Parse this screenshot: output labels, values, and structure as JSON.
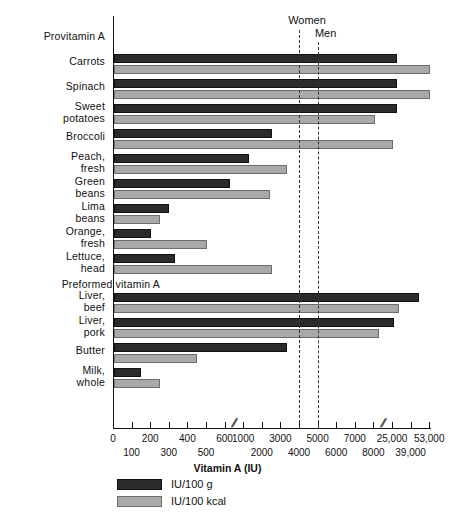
{
  "chart_data": {
    "type": "bar",
    "orientation": "horizontal",
    "title": "",
    "xlabel": "Vitamin A (IU)",
    "ylabel": "",
    "grid": false,
    "legend_position": "bottom-left",
    "axis_note": "broken axis: compressed scale segments",
    "tick_labels_upper": [
      "0",
      "200",
      "400",
      "600",
      "1000",
      "3000",
      "5000",
      "7000",
      "25,000",
      "53,000"
    ],
    "tick_labels_lower": [
      "100",
      "300",
      "500",
      "2000",
      "4000",
      "6000",
      "8000",
      "39,000"
    ],
    "reference_lines": [
      {
        "name": "Women",
        "label": "Women",
        "value": 4000
      },
      {
        "name": "Men",
        "label": "Men",
        "value": 5000
      }
    ],
    "group_headers": [
      {
        "label": "Provitamin A"
      },
      {
        "label": "Preformed vitamin A"
      }
    ],
    "series": [
      {
        "name": "IU/100 g",
        "label": "IU/100 g",
        "color": "#2b2b2b"
      },
      {
        "name": "IU/100 kcal",
        "label": "IU/100 kcal",
        "color": "#a9a9a9"
      }
    ],
    "categories": [
      "Carrots",
      "Spinach",
      "Sweet potatoes",
      "Broccoli",
      "Peach, fresh",
      "Green beans",
      "Lima beans",
      "Orange, fresh",
      "Lettuce, head",
      "Liver, beef",
      "Liver, pork",
      "Butter",
      "Milk, whole"
    ],
    "rows": [
      {
        "group": "Provitamin A",
        "name": "Carrots",
        "line1": "Carrots",
        "line2": "",
        "iu_per_100g": 28000,
        "iu_per_100kcal": 53000
      },
      {
        "group": "Provitamin A",
        "name": "Spinach",
        "line1": "Spinach",
        "line2": "",
        "iu_per_100g": 28000,
        "iu_per_100kcal": 53000
      },
      {
        "group": "Provitamin A",
        "name": "Sweet potatoes",
        "line1": "Sweet",
        "line2": "potatoes",
        "iu_per_100g": 28000,
        "iu_per_100kcal": 8500
      },
      {
        "group": "Provitamin A",
        "name": "Broccoli",
        "line1": "Broccoli",
        "line2": "",
        "iu_per_100g": 2500,
        "iu_per_100kcal": 25000
      },
      {
        "group": "Provitamin A",
        "name": "Peach, fresh",
        "line1": "Peach,",
        "line2": "fresh",
        "iu_per_100g": 1300,
        "iu_per_100kcal": 3300
      },
      {
        "group": "Provitamin A",
        "name": "Green beans",
        "line1": "Green",
        "line2": "beans",
        "iu_per_100g": 700,
        "iu_per_100kcal": 2400
      },
      {
        "group": "Provitamin A",
        "name": "Lima beans",
        "line1": "Lima",
        "line2": "beans",
        "iu_per_100g": 300,
        "iu_per_100kcal": 250
      },
      {
        "group": "Provitamin A",
        "name": "Orange, fresh",
        "line1": "Orange,",
        "line2": "fresh",
        "iu_per_100g": 200,
        "iu_per_100kcal": 500
      },
      {
        "group": "Provitamin A",
        "name": "Lettuce, head",
        "line1": "Lettuce,",
        "line2": "head",
        "iu_per_100g": 330,
        "iu_per_100kcal": 2500
      },
      {
        "group": "Preformed vitamin A",
        "name": "Liver, beef",
        "line1": "Liver,",
        "line2": "beef",
        "iu_per_100g": 45000,
        "iu_per_100kcal": 30000
      },
      {
        "group": "Preformed vitamin A",
        "name": "Liver, pork",
        "line1": "Liver,",
        "line2": "pork",
        "iu_per_100g": 26000,
        "iu_per_100kcal": 13000
      },
      {
        "group": "Preformed vitamin A",
        "name": "Butter",
        "line1": "Butter",
        "line2": "",
        "iu_per_100g": 3300,
        "iu_per_100kcal": 450
      },
      {
        "group": "Preformed vitamin A",
        "name": "Milk, whole",
        "line1": "Milk,",
        "line2": "whole",
        "iu_per_100g": 150,
        "iu_per_100kcal": 250
      }
    ]
  },
  "legend": {
    "items": [
      {
        "label": "IU/100 g",
        "color": "#2b2b2b"
      },
      {
        "label": "IU/100 kcal",
        "color": "#a9a9a9"
      }
    ]
  }
}
